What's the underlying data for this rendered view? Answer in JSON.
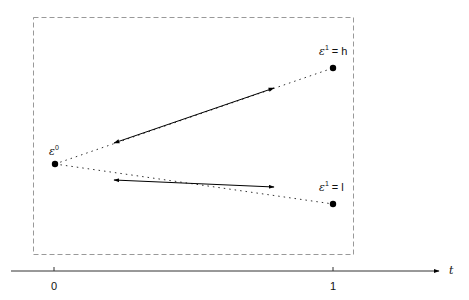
{
  "diagram": {
    "nodes": [
      {
        "id": "e0",
        "label_sym": "ε",
        "label_sup": "0",
        "label_rest": ""
      },
      {
        "id": "e1h",
        "label_sym": "ε",
        "label_sup": "1",
        "label_rest": " = h"
      },
      {
        "id": "e1l",
        "label_sym": "ε",
        "label_sup": "1",
        "label_rest": " = l"
      }
    ],
    "edges": [
      {
        "from": "e0",
        "to": "e1h",
        "style": "dotted with double arrow segment"
      },
      {
        "from": "e0",
        "to": "e1l",
        "style": "dotted with double arrow segment"
      }
    ],
    "axis": {
      "label": "t",
      "ticks": [
        "0",
        "1"
      ]
    }
  }
}
